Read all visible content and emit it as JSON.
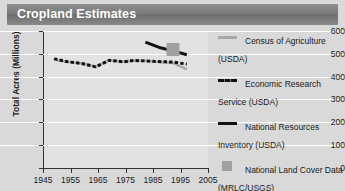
{
  "header": {
    "title": "Cropland Estimates"
  },
  "chart_data": {
    "type": "line",
    "title": "Cropland Estimates",
    "xlabel": "",
    "ylabel": "Total Acres (Millions)",
    "xlim": [
      1945,
      2005
    ],
    "ylim": [
      0,
      600
    ],
    "xticks": [
      1945,
      1955,
      1965,
      1975,
      1985,
      1995,
      2005
    ],
    "yticks": [
      0,
      100,
      200,
      300,
      400,
      500,
      600
    ],
    "grid": true,
    "legend_position": "right",
    "series": [
      {
        "name": "Census of Agriculture (USDA)",
        "style": "solid",
        "color": "#a8a8a8",
        "x": [
          1950,
          1954,
          1959,
          1964,
          1969,
          1974,
          1978,
          1982,
          1987,
          1992,
          1997
        ],
        "values": [
          472,
          465,
          458,
          444,
          472,
          465,
          471,
          469,
          464,
          460,
          432
        ]
      },
      {
        "name": "Economic Research Service (USDA)",
        "style": "dashed",
        "color": "#111111",
        "x": [
          1949,
          1954,
          1959,
          1964,
          1969,
          1974,
          1978,
          1982,
          1987,
          1992,
          1997
        ],
        "values": [
          478,
          465,
          458,
          443,
          472,
          465,
          471,
          469,
          466,
          464,
          455
        ]
      },
      {
        "name": "National Resources Inventory (USDA)",
        "style": "solid",
        "color": "#111111",
        "x": [
          1982,
          1987,
          1992,
          1997
        ],
        "values": [
          551,
          528,
          513,
          496
        ]
      },
      {
        "name": "National Land Cover Data (MRLC/USGS)",
        "style": "marker-square",
        "color": "#a0a0a0",
        "x": [
          1992
        ],
        "values": [
          519
        ]
      }
    ]
  },
  "legend": {
    "items": [
      {
        "label": "Census of Agriculture (USDA)",
        "swatch": "solid-gray-line-swatch"
      },
      {
        "label": "Economic Research Service (USDA)",
        "swatch": "dashed-black-line-swatch"
      },
      {
        "label": "National Resources Inventory (USDA)",
        "swatch": "solid-black-line-swatch"
      },
      {
        "label": "National Land Cover Data (MRLC/USGS)",
        "swatch": "gray-square-swatch"
      }
    ]
  },
  "axes": {
    "y_label": "Total Acres (Millions)",
    "y_ticks": [
      "600",
      "500",
      "400",
      "300",
      "200",
      "100",
      "0"
    ],
    "x_ticks": [
      "1945",
      "1955",
      "1965",
      "1975",
      "1985",
      "1995",
      "2005"
    ]
  }
}
